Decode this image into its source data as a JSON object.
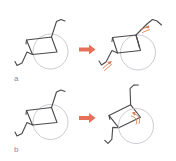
{
  "figure": {
    "type": "diagram",
    "title": "",
    "background_color": "#ffffff",
    "canvas": {
      "width": 176,
      "height": 161
    },
    "colors": {
      "frame_stroke": "#4a4a4a",
      "wheel_stroke": "#c8c3cc",
      "transition_arrow": "#e8705a",
      "motion_arrow": "#d98055",
      "label_text": "#8a8a9a"
    },
    "panels": [
      {
        "id": "a",
        "label": "a",
        "description": "Wheelchair backrest recline and footrest elevation",
        "before": {
          "name": "wheelchair-upright",
          "parts": [
            "seat-frame",
            "rear-wheel",
            "backrest",
            "footrest",
            "caster-strut"
          ]
        },
        "transition": {
          "name": "transition-arrow",
          "direction": "right",
          "color": "#e8705a"
        },
        "after": {
          "name": "wheelchair-reclined",
          "parts": [
            "seat-frame",
            "rear-wheel",
            "backrest-reclined",
            "footrest-elevated",
            "caster-strut"
          ],
          "motion_arrows": [
            {
              "name": "backrest-recline-arrow",
              "location": "upper-right",
              "direction": "counterclockwise"
            },
            {
              "name": "footrest-elevation-arrow",
              "location": "lower-left",
              "direction": "counterclockwise"
            }
          ]
        }
      },
      {
        "id": "b",
        "label": "b",
        "description": "Whole-chair tilt-in-space rotation about the rear axle",
        "before": {
          "name": "wheelchair-upright",
          "parts": [
            "seat-frame",
            "rear-wheel",
            "backrest",
            "footrest",
            "caster-strut"
          ]
        },
        "transition": {
          "name": "transition-arrow",
          "direction": "right",
          "color": "#e8705a"
        },
        "after": {
          "name": "wheelchair-tilted",
          "parts": [
            "seat-frame",
            "rear-wheel",
            "backrest",
            "footrest",
            "caster-strut"
          ],
          "motion_arrows": [
            {
              "name": "tilt-rotation-arrow",
              "location": "wheel-hub",
              "direction": "counterclockwise"
            }
          ]
        }
      }
    ]
  }
}
